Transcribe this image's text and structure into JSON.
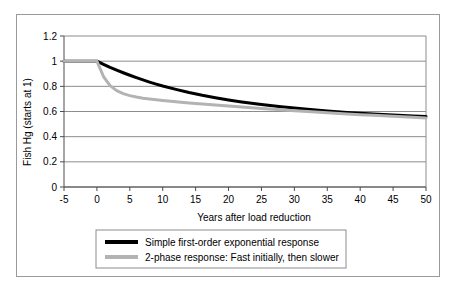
{
  "chart_data": {
    "type": "line",
    "title": "",
    "xlabel": "Years after load reduction",
    "ylabel": "Fish Hg (starts at 1)",
    "xlim": [
      -5,
      50
    ],
    "ylim": [
      0,
      1.2
    ],
    "xticks": [
      "-5",
      "0",
      "5",
      "10",
      "15",
      "20",
      "25",
      "30",
      "35",
      "40",
      "45",
      "50"
    ],
    "xtick_values": [
      -5,
      0,
      5,
      10,
      15,
      20,
      25,
      30,
      35,
      40,
      45,
      50
    ],
    "yticks": [
      "0",
      "0.2",
      "0.4",
      "0.6",
      "0.8",
      "1",
      "1.2"
    ],
    "ytick_values": [
      0,
      0.2,
      0.4,
      0.6,
      0.8,
      1,
      1.2
    ],
    "grid": "horizontal",
    "legend_position": "below-axes",
    "x": [
      -5,
      -4,
      -3,
      -2,
      -1,
      0,
      1,
      2,
      3,
      4,
      5,
      6,
      7,
      8,
      9,
      10,
      12,
      14,
      16,
      18,
      20,
      22,
      25,
      28,
      30,
      32,
      35,
      38,
      40,
      42,
      45,
      48,
      50
    ],
    "series": [
      {
        "name": "Simple first-order exponential response",
        "color": "#000000",
        "linewidth": 3,
        "values": [
          1,
          1,
          1,
          1,
          1,
          1,
          0.975,
          0.951,
          0.929,
          0.908,
          0.888,
          0.869,
          0.851,
          0.834,
          0.818,
          0.803,
          0.776,
          0.751,
          0.729,
          0.71,
          0.692,
          0.676,
          0.655,
          0.637,
          0.627,
          0.617,
          0.604,
          0.593,
          0.586,
          0.58,
          0.572,
          0.564,
          0.56
        ]
      },
      {
        "name": "2-phase response: Fast initially, then slower",
        "color": "#b3b3b3",
        "linewidth": 3,
        "values": [
          1,
          1,
          1,
          1,
          1,
          1,
          0.878,
          0.806,
          0.766,
          0.742,
          0.726,
          0.715,
          0.706,
          0.699,
          0.693,
          0.687,
          0.677,
          0.668,
          0.659,
          0.651,
          0.643,
          0.635,
          0.624,
          0.613,
          0.606,
          0.6,
          0.59,
          0.581,
          0.575,
          0.57,
          0.562,
          0.554,
          0.549
        ]
      }
    ],
    "legend": [
      {
        "label": "Simple first-order exponential response",
        "color": "#000000"
      },
      {
        "label": "2-phase response: Fast initially, then slower",
        "color": "#b3b3b3"
      }
    ]
  }
}
